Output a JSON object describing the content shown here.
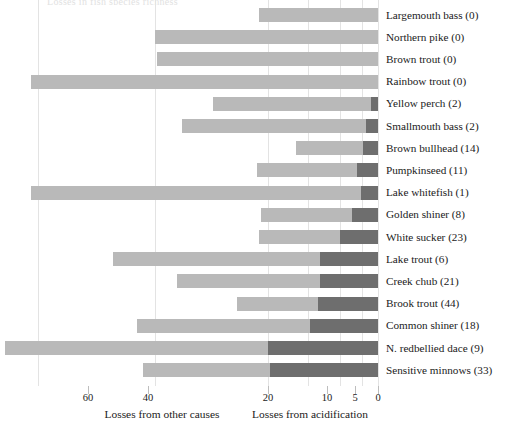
{
  "chart": {
    "title_sliver": "Losses in fish species richness",
    "axis": {
      "ticks": [
        {
          "value": 60,
          "x": 88
        },
        {
          "value": 40,
          "x": 148
        },
        {
          "value": 20,
          "x": 268
        },
        {
          "value": 10,
          "x": 327
        },
        {
          "value": 5,
          "x": 355
        },
        {
          "value": 0,
          "x": 378
        }
      ],
      "gridlines_x": [
        38,
        155,
        268,
        308,
        340,
        362,
        378
      ],
      "captions": [
        {
          "text": "Losses from other causes",
          "x": 162
        },
        {
          "text": "Losses from acidification",
          "x": 310
        }
      ]
    },
    "legend": {
      "other_causes_color": "#b9b9b9",
      "acidification_color": "#6e6e6e"
    }
  },
  "chart_data": {
    "type": "bar",
    "orientation": "horizontal",
    "stacked": true,
    "title": "Losses in fish species richness",
    "xlabel": "",
    "ylabel": "",
    "xlim": [
      60,
      0
    ],
    "x_reversed": true,
    "x_nonlinear": true,
    "grid": true,
    "legend_position": "below-axis",
    "xtick_labels": [
      "60",
      "40",
      "20",
      "10",
      "5",
      "0"
    ],
    "xticks": [
      60,
      40,
      20,
      10,
      5,
      0
    ],
    "axis_captions": [
      "Losses from other causes",
      "Losses from acidification"
    ],
    "series": [
      {
        "name": "Losses from other causes",
        "color": "#b9b9b9"
      },
      {
        "name": "Losses from acidification",
        "color": "#6e6e6e"
      }
    ],
    "categories": [
      "Largemouth bass (0)",
      "Northern pike (0)",
      "Brown trout (0)",
      "Rainbow trout (0)",
      "Yellow perch (2)",
      "Smallmouth bass (2)",
      "Brown bullhead (14)",
      "Pumpkinseed (11)",
      "Lake whitefish (1)",
      "Golden shiner (8)",
      "White sucker (23)",
      "Lake trout (6)",
      "Creek chub (21)",
      "Brook trout (44)",
      "Common shiner (18)",
      "N. redbellied dace (9)",
      "Sensitive minnows (33)"
    ],
    "bars": [
      {
        "category": "Largemouth bass (0)",
        "count": 0,
        "bar_start_px": 259,
        "dark_start_px": 378,
        "bar_end_px": 378
      },
      {
        "category": "Northern pike (0)",
        "count": 0,
        "bar_start_px": 155,
        "dark_start_px": 378,
        "bar_end_px": 378
      },
      {
        "category": "Brown trout (0)",
        "count": 0,
        "bar_start_px": 157,
        "dark_start_px": 378,
        "bar_end_px": 378
      },
      {
        "category": "Rainbow trout (0)",
        "count": 0,
        "bar_start_px": 31,
        "dark_start_px": 378,
        "bar_end_px": 378
      },
      {
        "category": "Yellow perch (2)",
        "count": 2,
        "bar_start_px": 213,
        "dark_start_px": 371,
        "bar_end_px": 378
      },
      {
        "category": "Smallmouth bass (2)",
        "count": 2,
        "bar_start_px": 182,
        "dark_start_px": 366,
        "bar_end_px": 378
      },
      {
        "category": "Brown bullhead (14)",
        "count": 14,
        "bar_start_px": 296,
        "dark_start_px": 363,
        "bar_end_px": 378
      },
      {
        "category": "Pumpkinseed (11)",
        "count": 11,
        "bar_start_px": 257,
        "dark_start_px": 357,
        "bar_end_px": 378
      },
      {
        "category": "Lake whitefish (1)",
        "count": 1,
        "bar_start_px": 31,
        "dark_start_px": 361,
        "bar_end_px": 378
      },
      {
        "category": "Golden shiner (8)",
        "count": 8,
        "bar_start_px": 261,
        "dark_start_px": 352,
        "bar_end_px": 378
      },
      {
        "category": "White sucker (23)",
        "count": 23,
        "bar_start_px": 259,
        "dark_start_px": 340,
        "bar_end_px": 378
      },
      {
        "category": "Lake trout (6)",
        "count": 6,
        "bar_start_px": 113,
        "dark_start_px": 320,
        "bar_end_px": 378
      },
      {
        "category": "Creek chub (21)",
        "count": 21,
        "bar_start_px": 177,
        "dark_start_px": 320,
        "bar_end_px": 378
      },
      {
        "category": "Brook trout (44)",
        "count": 44,
        "bar_start_px": 237,
        "dark_start_px": 318,
        "bar_end_px": 378
      },
      {
        "category": "Common shiner (18)",
        "count": 18,
        "bar_start_px": 137,
        "dark_start_px": 310,
        "bar_end_px": 378
      },
      {
        "category": "N. redbellied dace (9)",
        "count": 9,
        "bar_start_px": 5,
        "dark_start_px": 268,
        "bar_end_px": 378
      },
      {
        "category": "Sensitive minnows (33)",
        "count": 33,
        "bar_start_px": 143,
        "dark_start_px": 270,
        "bar_end_px": 378
      }
    ]
  }
}
